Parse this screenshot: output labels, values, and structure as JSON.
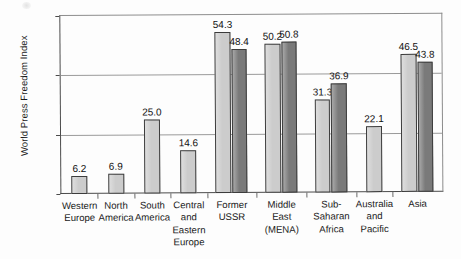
{
  "chart_data": {
    "type": "bar",
    "title": "",
    "subtitle": "",
    "xlabel": "",
    "ylabel": "World Press Freedom Index",
    "ylim": [
      0,
      60
    ],
    "yticks": [
      "0",
      "20",
      "40",
      "60"
    ],
    "ytick_values": [
      0,
      20,
      40,
      60
    ],
    "grid": true,
    "grid_axis": "y",
    "legend": "none",
    "categories": [
      "Western Europe",
      "North America",
      "South America",
      "Central and Eastern Europe",
      "Former USSR",
      "Middle East (MENA)",
      "Sub-Saharan Africa",
      "Australia and Pacific",
      "Asia"
    ],
    "category_lines": [
      [
        "Western",
        "Europe"
      ],
      [
        "North",
        "America"
      ],
      [
        "South",
        "America"
      ],
      [
        "Central",
        "and",
        "Eastern",
        "Europe"
      ],
      [
        "Former",
        "USSR"
      ],
      [
        "Middle",
        "East",
        "(MENA)"
      ],
      [
        "Sub-",
        "Saharan",
        "Africa"
      ],
      [
        "Australia",
        "and",
        "Pacific"
      ],
      [
        "Asia"
      ]
    ],
    "series": [
      {
        "name": "series-light",
        "color": "#cccccc",
        "values": [
          6.2,
          6.9,
          25.0,
          14.6,
          54.3,
          50.2,
          31.3,
          22.1,
          46.5
        ],
        "labels": [
          "6.2",
          "6.9",
          "25.0",
          "14.6",
          "54.3",
          "50.2",
          "31.3",
          "22.1",
          "46.5"
        ]
      },
      {
        "name": "series-dark",
        "color": "#7a7a7a",
        "values": [
          null,
          null,
          null,
          null,
          48.4,
          50.8,
          36.9,
          null,
          43.8
        ],
        "labels": [
          "",
          "",
          "",
          "",
          "48.4",
          "50.8",
          "36.9",
          "",
          "43.8"
        ]
      }
    ]
  },
  "colors": {
    "light_bar": "#cccccc",
    "dark_bar": "#7a7a7a",
    "bar_outline": "#3c3c3c",
    "axis": "#4b4b4b",
    "gridline": "#9a9a9a",
    "text": "#1a1a1a",
    "background": "#ffffff"
  }
}
